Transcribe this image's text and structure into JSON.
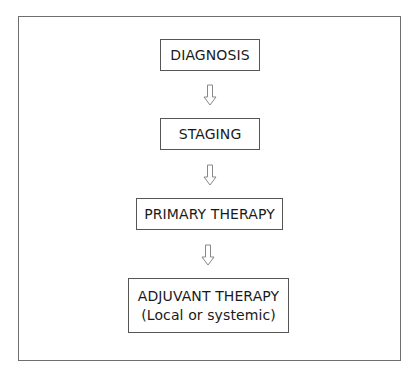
{
  "diagram": {
    "type": "flowchart",
    "direction": "top-to-bottom",
    "nodes": [
      {
        "id": "diagnosis",
        "lines": [
          "DIAGNOSIS"
        ]
      },
      {
        "id": "staging",
        "lines": [
          "STAGING"
        ]
      },
      {
        "id": "primary",
        "lines": [
          "PRIMARY THERAPY"
        ]
      },
      {
        "id": "adjuvant",
        "lines": [
          "ADJUVANT THERAPY",
          "(Local or systemic)"
        ]
      }
    ],
    "edges": [
      {
        "from": "diagnosis",
        "to": "staging",
        "style": "hollow-down-arrow"
      },
      {
        "from": "staging",
        "to": "primary",
        "style": "hollow-down-arrow"
      },
      {
        "from": "primary",
        "to": "adjuvant",
        "style": "hollow-down-arrow"
      }
    ]
  }
}
